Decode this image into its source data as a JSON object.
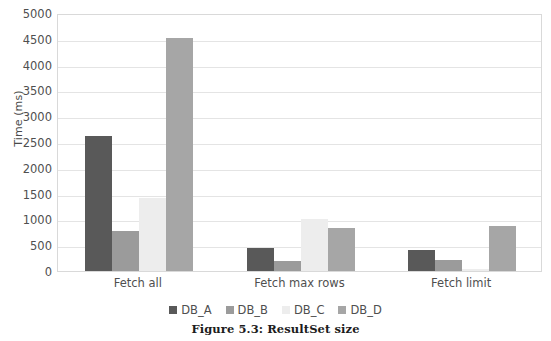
{
  "caption": "Figure 5.3: ResultSet size",
  "chart_data": {
    "type": "bar",
    "title": "",
    "xlabel": "",
    "ylabel": "Time (ms)",
    "ylim": [
      0,
      5000
    ],
    "ytick_step": 500,
    "yticks": [
      "5000",
      "4500",
      "4000",
      "3500",
      "3000",
      "2500",
      "2000",
      "1500",
      "1000",
      "500",
      "0"
    ],
    "grid": true,
    "legend_position": "bottom",
    "categories": [
      "Fetch all",
      "Fetch max rows",
      "Fetch limit"
    ],
    "series": [
      {
        "name": "DB_A",
        "color": "#595959",
        "values": [
          2620,
          450,
          400
        ]
      },
      {
        "name": "DB_B",
        "color": "#9b9b9b",
        "values": [
          770,
          200,
          210
        ]
      },
      {
        "name": "DB_C",
        "color": "#ededed",
        "values": [
          1420,
          1000,
          30
        ]
      },
      {
        "name": "DB_D",
        "color": "#a6a6a6",
        "values": [
          4520,
          830,
          880
        ]
      }
    ]
  }
}
